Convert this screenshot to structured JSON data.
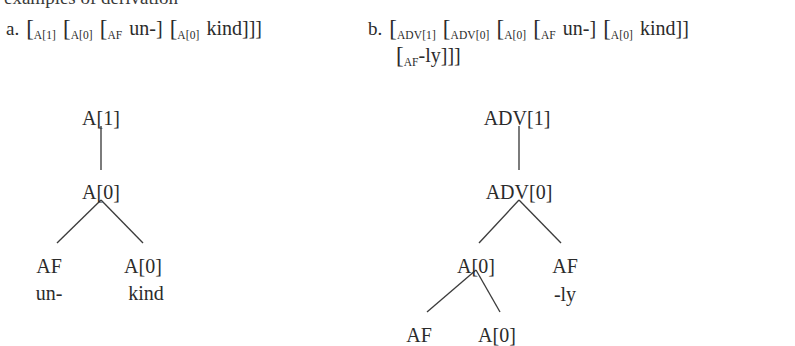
{
  "heading": "examples of derivation",
  "items": [
    {
      "label": "a.",
      "bracket_line1": [
        {
          "type": "bracket",
          "text": "["
        },
        {
          "type": "subscript",
          "text": "A[1]"
        },
        {
          "type": "gap"
        },
        {
          "type": "bracket",
          "text": "["
        },
        {
          "type": "subscript",
          "text": "A[0]"
        },
        {
          "type": "gap"
        },
        {
          "type": "bracket",
          "text": "["
        },
        {
          "type": "subscript",
          "text": "AF"
        },
        {
          "type": "gap"
        },
        {
          "type": "word",
          "text": "un-]"
        },
        {
          "type": "gap"
        },
        {
          "type": "bracket",
          "text": "["
        },
        {
          "type": "subscript",
          "text": "A[0]"
        },
        {
          "type": "gap"
        },
        {
          "type": "word",
          "text": "kind]]]"
        }
      ],
      "bracket_line2": []
    },
    {
      "label": "b.",
      "bracket_line1": [
        {
          "type": "bracket",
          "text": "["
        },
        {
          "type": "subscript",
          "text": "ADV[1]"
        },
        {
          "type": "gap"
        },
        {
          "type": "bracket",
          "text": "["
        },
        {
          "type": "subscript",
          "text": "ADV[0]"
        },
        {
          "type": "gap"
        },
        {
          "type": "bracket",
          "text": "["
        },
        {
          "type": "subscript",
          "text": "A[0]"
        },
        {
          "type": "gap"
        },
        {
          "type": "bracket",
          "text": "["
        },
        {
          "type": "subscript",
          "text": "AF"
        },
        {
          "type": "gap"
        },
        {
          "type": "word",
          "text": "un-]"
        },
        {
          "type": "gap"
        },
        {
          "type": "bracket",
          "text": "["
        },
        {
          "type": "subscript",
          "text": "A[0]"
        },
        {
          "type": "gap"
        },
        {
          "type": "word",
          "text": "kind]]"
        }
      ],
      "bracket_line2": [
        {
          "type": "bracket",
          "text": "["
        },
        {
          "type": "subscript",
          "text": "AF"
        },
        {
          "type": "word",
          "text": "-ly]]]"
        }
      ]
    }
  ],
  "tree_a": {
    "name": "derivation-tree-unkind",
    "nodes": [
      {
        "id": "a-root",
        "label": "A[1]",
        "x": 101,
        "y": 108
      },
      {
        "id": "a-mid",
        "label": "A[0]",
        "x": 101,
        "y": 182
      },
      {
        "id": "a-af",
        "label": "AF",
        "x": 49,
        "y": 256
      },
      {
        "id": "a-adj",
        "label": "A[0]",
        "x": 143,
        "y": 256
      }
    ],
    "leaves": [
      {
        "id": "a-af-word",
        "label": "un-",
        "x": 49,
        "y": 283
      },
      {
        "id": "a-adj-word",
        "label": "kind",
        "x": 146,
        "y": 283
      }
    ],
    "edges": [
      {
        "x1": 101,
        "y1": 126,
        "x2": 101,
        "y2": 170
      },
      {
        "x1": 101,
        "y1": 200,
        "x2": 57,
        "y2": 243
      },
      {
        "x1": 101,
        "y1": 200,
        "x2": 143,
        "y2": 243
      }
    ]
  },
  "tree_b": {
    "name": "derivation-tree-unkindly",
    "nodes": [
      {
        "id": "b-root",
        "label": "ADV[1]",
        "x": 517,
        "y": 108
      },
      {
        "id": "b-mid",
        "label": "ADV[0]",
        "x": 519,
        "y": 182
      },
      {
        "id": "b-adj",
        "label": "A[0]",
        "x": 476,
        "y": 256
      },
      {
        "id": "b-af-ly",
        "label": "AF",
        "x": 565,
        "y": 256
      },
      {
        "id": "b-af-un",
        "label": "AF",
        "x": 419,
        "y": 325
      },
      {
        "id": "b-adj2",
        "label": "A[0]",
        "x": 497,
        "y": 325
      }
    ],
    "leaves": [
      {
        "id": "b-ly-word",
        "label": "-ly",
        "x": 565,
        "y": 284
      }
    ],
    "edges": [
      {
        "x1": 519,
        "y1": 126,
        "x2": 519,
        "y2": 170
      },
      {
        "x1": 519,
        "y1": 200,
        "x2": 479,
        "y2": 243
      },
      {
        "x1": 519,
        "y1": 200,
        "x2": 561,
        "y2": 243
      },
      {
        "x1": 476,
        "y1": 270,
        "x2": 427,
        "y2": 312
      },
      {
        "x1": 476,
        "y1": 270,
        "x2": 500,
        "y2": 312
      }
    ]
  }
}
